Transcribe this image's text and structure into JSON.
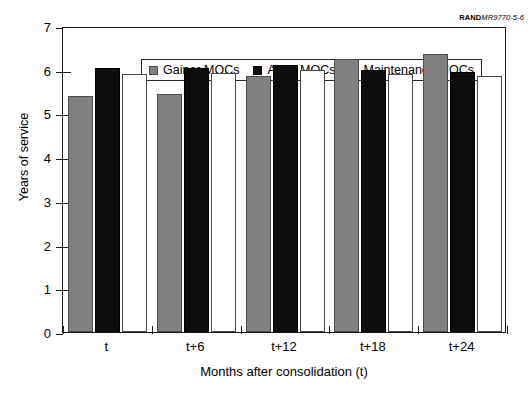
{
  "source_credit": {
    "mark": "RAND",
    "document": "MR9770-5-6"
  },
  "legend": {
    "position": "top-left-inside",
    "entries": [
      {
        "label": "Gainer MOCs",
        "color": "#808080",
        "key": "gainer"
      },
      {
        "label": "Army MOCs",
        "color": "#0d0d0d",
        "key": "army"
      },
      {
        "label": "Maintenance MOCs",
        "color": "#ffffff",
        "key": "maintenance"
      }
    ]
  },
  "chart_data": {
    "type": "bar",
    "title": "",
    "xlabel": "Months after consolidation (t)",
    "ylabel": "Years of service",
    "categories": [
      "t",
      "t+6",
      "t+12",
      "t+18",
      "t+24"
    ],
    "series": [
      {
        "name": "Gainer MOCs",
        "color": "#808080",
        "values": [
          5.4,
          5.45,
          5.85,
          6.25,
          6.35
        ]
      },
      {
        "name": "Army MOCs",
        "color": "#0d0d0d",
        "values": [
          6.05,
          6.05,
          6.1,
          6.0,
          5.95
        ]
      },
      {
        "name": "Maintenance MOCs",
        "color": "#ffffff",
        "values": [
          5.9,
          5.93,
          6.0,
          5.9,
          5.85
        ]
      }
    ],
    "ylim": [
      0,
      7
    ],
    "yticks": [
      0,
      1,
      2,
      3,
      4,
      5,
      6,
      7
    ],
    "yticklabels": [
      "0",
      "1",
      "2",
      "3",
      "4",
      "5",
      "6",
      "7"
    ],
    "grid": false,
    "legend_position": "upper left"
  }
}
